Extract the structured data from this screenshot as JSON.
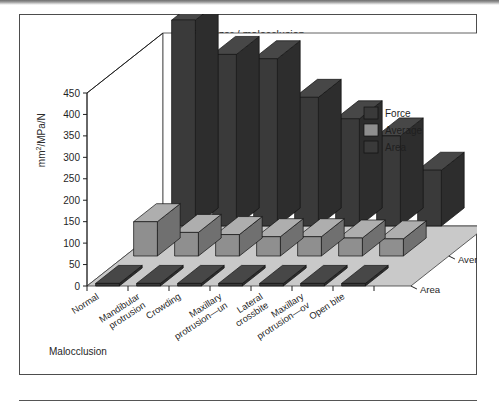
{
  "figure": {
    "title": "Occluzer / malocclusion",
    "y_axis_label_html": "mm2/MPa/N",
    "x_axis_name": "Malocclusion",
    "frame_border_color": "#4d4d4d"
  },
  "legend": {
    "position": "top-right",
    "items": [
      {
        "label": "Force",
        "color": "#3a3a3a"
      },
      {
        "label": "Average",
        "color": "#8f8f8f"
      },
      {
        "label": "Area",
        "color": "#3a3a3a"
      }
    ]
  },
  "depth_axis": {
    "labels": [
      "Force",
      "Average",
      "Area"
    ]
  },
  "chart_data": {
    "type": "bar",
    "subtype": "3d-grouped-bar",
    "title": "Occluzer / malocclusion",
    "xlabel": "Malocclusion",
    "ylabel": "mm2/MPa/N",
    "ylim": [
      0,
      450
    ],
    "yticks": [
      0,
      50,
      100,
      150,
      200,
      250,
      300,
      350,
      400,
      450
    ],
    "grid": false,
    "legend_position": "top-right",
    "categories": [
      "Normal",
      "Mandibular protrusion",
      "Crowding",
      "Maxillary protrusion—un",
      "Lateral crossbite",
      "Maxillary protrusion—ov",
      "Open bite"
    ],
    "category_lines": [
      [
        "Normal"
      ],
      [
        "Mandibular",
        "protrusion"
      ],
      [
        "Crowding"
      ],
      [
        "Maxillary",
        "protrusion—un"
      ],
      [
        "Lateral",
        "crossbite"
      ],
      [
        "Maxillary",
        "protrusion—ov"
      ],
      [
        "Open bite"
      ]
    ],
    "series": [
      {
        "name": "Force",
        "color": "#3a3a3a",
        "values": [
          480,
          400,
          390,
          300,
          250,
          210,
          130
        ]
      },
      {
        "name": "Average",
        "color": "#8f8f8f",
        "values": [
          80,
          55,
          50,
          45,
          45,
          42,
          40
        ]
      },
      {
        "name": "Area",
        "color": "#3a3a3a",
        "values": [
          6,
          6,
          6,
          6,
          6,
          6,
          6
        ]
      }
    ]
  }
}
